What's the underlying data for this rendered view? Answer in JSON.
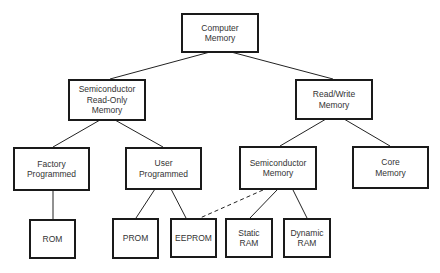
{
  "diagram": {
    "type": "tree",
    "nodes": {
      "computer_memory": {
        "label": "Computer\nMemory"
      },
      "semi_rom": {
        "label": "Semiconductor\nRead-Only\nMemory"
      },
      "read_write": {
        "label": "Read/Write\nMemory"
      },
      "factory": {
        "label": "Factory\nProgrammed"
      },
      "user": {
        "label": "User\nProgrammed"
      },
      "semi_mem": {
        "label": "Semiconductor\nMemory"
      },
      "core": {
        "label": "Core\nMemory"
      },
      "rom": {
        "label": "ROM"
      },
      "prom": {
        "label": "PROM"
      },
      "eeprom": {
        "label": "EEPROM"
      },
      "static_ram": {
        "label": "Static\nRAM"
      },
      "dynamic_ram": {
        "label": "Dynamic\nRAM"
      }
    },
    "edges": [
      {
        "from": "computer_memory",
        "to": "semi_rom",
        "style": "solid"
      },
      {
        "from": "computer_memory",
        "to": "read_write",
        "style": "solid"
      },
      {
        "from": "semi_rom",
        "to": "factory",
        "style": "solid"
      },
      {
        "from": "semi_rom",
        "to": "user",
        "style": "solid"
      },
      {
        "from": "read_write",
        "to": "semi_mem",
        "style": "solid"
      },
      {
        "from": "read_write",
        "to": "core",
        "style": "solid"
      },
      {
        "from": "factory",
        "to": "rom",
        "style": "solid"
      },
      {
        "from": "user",
        "to": "prom",
        "style": "solid"
      },
      {
        "from": "user",
        "to": "eeprom",
        "style": "solid"
      },
      {
        "from": "semi_mem",
        "to": "eeprom",
        "style": "dashed"
      },
      {
        "from": "semi_mem",
        "to": "static_ram",
        "style": "solid"
      },
      {
        "from": "semi_mem",
        "to": "dynamic_ram",
        "style": "solid"
      }
    ]
  }
}
